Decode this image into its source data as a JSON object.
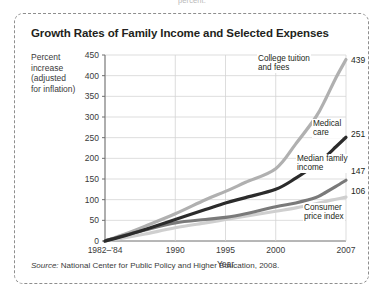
{
  "top_cutoff_text": "percent.",
  "figure": {
    "title": "Growth Rates of Family Income and Selected Expenses",
    "y_axis_caption": [
      "Percent",
      "increase",
      "(adjusted",
      "for inflation)"
    ],
    "source_prefix": "Source:",
    "source_text": "National Center for Public Policy and Higher Education, 2008."
  },
  "chart_data": {
    "type": "line",
    "title": "Growth Rates of Family Income and Selected Expenses",
    "xlabel": "Year",
    "ylabel": "Percent increase (adjusted for inflation)",
    "xlim": [
      1983,
      2007
    ],
    "ylim": [
      0,
      450
    ],
    "grid": true,
    "legend_position": "inline-right",
    "y_ticks": [
      0,
      50,
      100,
      150,
      200,
      250,
      300,
      350,
      400,
      450
    ],
    "x_ticks": [
      1983,
      1990,
      1995,
      2000,
      2007
    ],
    "x_tick_labels": [
      "1982–'84",
      "1990",
      "1995",
      "2000",
      "2007"
    ],
    "series": [
      {
        "name": "College tuition and fees",
        "color": "#b0b0b0",
        "end_value": 439,
        "x": [
          1983,
          1985,
          1987,
          1990,
          1993,
          1995,
          1997,
          2000,
          2002,
          2004,
          2005,
          2006,
          2007
        ],
        "values": [
          0,
          17,
          36,
          66,
          100,
          120,
          142,
          175,
          235,
          300,
          345,
          395,
          439
        ]
      },
      {
        "name": "Medical care",
        "color": "#2b2b2b",
        "end_value": 251,
        "x": [
          1983,
          1985,
          1987,
          1990,
          1993,
          1995,
          1997,
          2000,
          2002,
          2004,
          2005,
          2006,
          2007
        ],
        "values": [
          0,
          13,
          28,
          52,
          76,
          92,
          105,
          125,
          152,
          185,
          205,
          228,
          251
        ]
      },
      {
        "name": "Median family income",
        "color": "#7a7a7a",
        "end_value": 147,
        "x": [
          1983,
          1985,
          1987,
          1990,
          1993,
          1995,
          1997,
          2000,
          2002,
          2004,
          2005,
          2006,
          2007
        ],
        "values": [
          0,
          14,
          27,
          44,
          52,
          57,
          66,
          83,
          92,
          105,
          118,
          132,
          147
        ]
      },
      {
        "name": "Consumer price index",
        "color": "#cfcfcf",
        "end_value": 106,
        "x": [
          1983,
          1985,
          1987,
          1990,
          1993,
          1995,
          1997,
          2000,
          2002,
          2004,
          2005,
          2006,
          2007
        ],
        "values": [
          0,
          8,
          17,
          32,
          44,
          52,
          60,
          72,
          80,
          90,
          96,
          101,
          106
        ]
      }
    ],
    "series_labels": [
      {
        "lines": [
          "College tuition",
          "and fees"
        ]
      },
      {
        "lines": [
          "Medical",
          "care"
        ]
      },
      {
        "lines": [
          "Median family",
          "income"
        ]
      },
      {
        "lines": [
          "Consumer",
          "price index"
        ]
      }
    ]
  }
}
